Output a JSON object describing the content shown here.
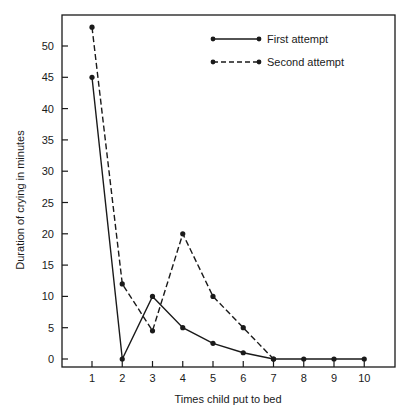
{
  "chart_data": {
    "type": "line",
    "title": "",
    "xlabel": "Times child put to bed",
    "ylabel": "Duration of crying in minutes",
    "x": [
      1,
      2,
      3,
      4,
      5,
      6,
      7,
      8,
      9,
      10
    ],
    "x_ticks": [
      "1",
      "2",
      "3",
      "4",
      "5",
      "6",
      "7",
      "8",
      "9",
      "10"
    ],
    "y_ticks": [
      "0",
      "5",
      "10",
      "15",
      "20",
      "25",
      "30",
      "35",
      "40",
      "45",
      "50"
    ],
    "ylim": [
      0,
      55
    ],
    "xlim": [
      0,
      11
    ],
    "grid": false,
    "legend_position": "upper right (inside)",
    "series": [
      {
        "name": "First attempt",
        "style": "solid",
        "x": [
          1,
          2,
          3,
          4,
          5,
          6,
          7,
          8,
          9,
          10
        ],
        "values": [
          45,
          0,
          10,
          5,
          2.5,
          1,
          0,
          0,
          0,
          0
        ]
      },
      {
        "name": "Second attempt",
        "style": "dashed",
        "x": [
          1,
          2,
          3,
          4,
          5,
          6,
          7
        ],
        "values": [
          53,
          12,
          4.5,
          20,
          10,
          5,
          0
        ]
      }
    ]
  },
  "colors": {
    "line": "#1a1a1a",
    "background": "#ffffff"
  }
}
